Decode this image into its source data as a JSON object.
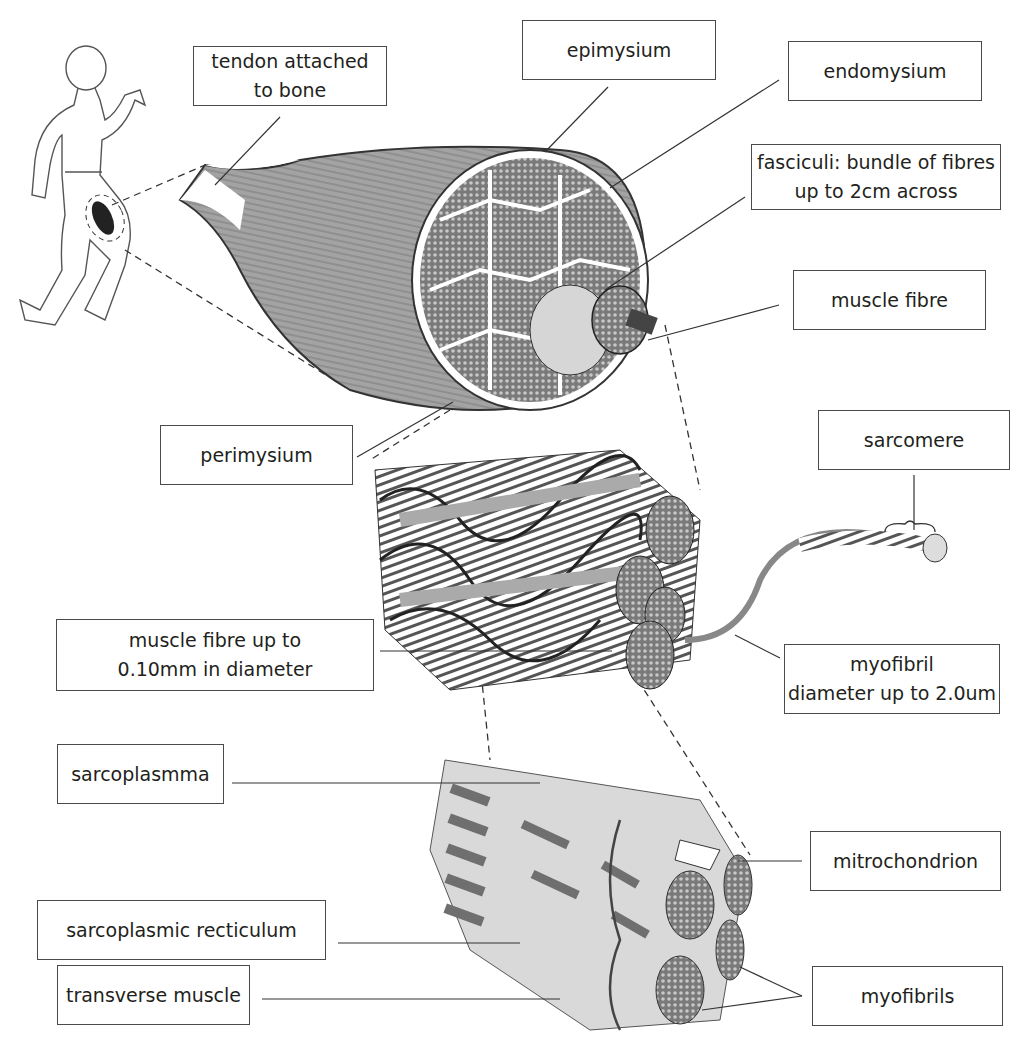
{
  "labels": {
    "tendon": "tendon attached\nto bone",
    "epimysium": "epimysium",
    "endomysium": "endomysium",
    "fasciculi": "fasciculi: bundle of fibres\nup to 2cm across",
    "muscle_fibre": "muscle fibre",
    "perimysium": "perimysium",
    "sarcomere": "sarcomere",
    "muscle_fibre_size": "muscle fibre up to\n0.10mm in diameter",
    "myofibril": "myofibril\ndiameter up to 2.0um",
    "sarcoplasmma": "sarcoplasmma",
    "mitrochondrion": "mitrochondrion",
    "sarcoplasmic_recticulum": "sarcoplasmic recticulum",
    "transverse_muscle": "transverse muscle",
    "myofibrils": "myofibrils"
  },
  "colors": {
    "line": "#3a3a3a",
    "muscle_grey": "#a0a0a0",
    "dark_grey": "#6a6a6a",
    "light_grey": "#d8d8d8"
  }
}
